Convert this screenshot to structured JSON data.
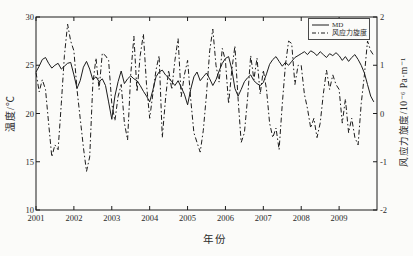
{
  "figure": {
    "background": "#fbfbf9",
    "line_color": "#1c1c1c",
    "tick_label_color": "#2a2a2a"
  },
  "chart_data": {
    "type": "line",
    "title": "",
    "xlabel": "年份",
    "ylabel_left": "温度/℃",
    "ylabel_right": "风应力旋度/10⁻⁶ Pa·m⁻¹",
    "x_range": [
      2001,
      2010
    ],
    "x_tick_labels": [
      "2001",
      "2002",
      "2003",
      "2004",
      "2005",
      "2006",
      "2007",
      "2008",
      "2009"
    ],
    "x_tick_values": [
      2001,
      2002,
      2003,
      2004,
      2005,
      2006,
      2007,
      2008,
      2009
    ],
    "ylim_left": [
      10,
      30
    ],
    "yticks_left": [
      10,
      15,
      20,
      25,
      30
    ],
    "ylim_right": [
      -2,
      2
    ],
    "yticks_right": [
      -2,
      -1,
      0,
      1,
      2
    ],
    "grid": false,
    "legend_position": "top-right-inside",
    "legend": [
      {
        "name": "MD",
        "style": "solid"
      },
      {
        "name": "风应力旋度",
        "style": "dashdot"
      }
    ],
    "x_start": 2001.0,
    "x_step": 0.0833333,
    "series": [
      {
        "name": "MD",
        "axis": "left",
        "style": "solid",
        "values": [
          24.3,
          24.9,
          25.6,
          25.8,
          25.2,
          24.7,
          25.0,
          25.2,
          24.6,
          24.9,
          25.2,
          25.3,
          24.0,
          22.6,
          23.4,
          24.8,
          25.4,
          24.6,
          23.5,
          23.8,
          23.3,
          23.6,
          22.9,
          21.2,
          19.4,
          21.8,
          23.3,
          24.4,
          23.1,
          23.6,
          23.9,
          23.6,
          23.4,
          22.9,
          22.3,
          21.8,
          21.2,
          22.4,
          23.8,
          24.3,
          24.5,
          24.0,
          23.7,
          23.3,
          22.9,
          23.4,
          22.7,
          22.0,
          20.9,
          22.5,
          23.8,
          24.3,
          23.4,
          23.8,
          24.2,
          23.6,
          22.9,
          23.5,
          24.4,
          25.2,
          25.7,
          25.9,
          24.6,
          22.6,
          21.8,
          22.5,
          23.3,
          23.7,
          24.0,
          23.4,
          23.1,
          22.9,
          23.2,
          24.1,
          25.1,
          25.6,
          25.9,
          25.4,
          24.9,
          25.3,
          25.0,
          25.4,
          25.8,
          26.0,
          26.2,
          26.4,
          26.1,
          26.5,
          26.3,
          26.0,
          26.4,
          26.1,
          25.8,
          26.2,
          26.0,
          26.3,
          26.0,
          25.5,
          25.9,
          25.4,
          25.8,
          26.1,
          25.6,
          25.0,
          24.2,
          23.0,
          21.8,
          21.2
        ]
      },
      {
        "name": "风应力旋度",
        "axis": "right",
        "style": "dashdot",
        "values": [
          0.85,
          0.45,
          0.7,
          0.5,
          -0.2,
          -0.9,
          -0.65,
          -0.75,
          0.2,
          1.2,
          1.85,
          1.5,
          1.3,
          0.5,
          -0.1,
          -0.7,
          -1.2,
          -0.9,
          0.6,
          1.15,
          0.5,
          1.25,
          1.2,
          1.1,
          0.2,
          -0.15,
          0.35,
          0.6,
          -0.2,
          -0.55,
          0.8,
          1.6,
          0.45,
          1.2,
          1.65,
          0.6,
          -0.1,
          0.4,
          0.9,
          1.2,
          -0.5,
          0.3,
          0.9,
          0.5,
          1.1,
          1.55,
          0.35,
          0.8,
          1.1,
          0.3,
          -0.4,
          -0.6,
          -0.8,
          -0.35,
          0.4,
          1.3,
          1.75,
          1.0,
          0.65,
          1.35,
          1.1,
          0.2,
          0.9,
          1.4,
          0.3,
          -0.6,
          -0.4,
          0.3,
          1.2,
          0.7,
          1.15,
          0.4,
          0.9,
          0.5,
          -0.2,
          -0.5,
          -0.3,
          -0.75,
          0.2,
          1.0,
          1.5,
          1.45,
          0.6,
          1.0,
          1.0,
          0.4,
          0.1,
          -0.3,
          -0.1,
          -0.5,
          -0.2,
          0.4,
          0.9,
          0.5,
          0.8,
          0.6,
          0.5,
          -0.2,
          0.3,
          -0.4,
          -0.1,
          -0.5,
          -0.65,
          0.2,
          0.8,
          1.5,
          1.3,
          1.2
        ]
      }
    ]
  }
}
